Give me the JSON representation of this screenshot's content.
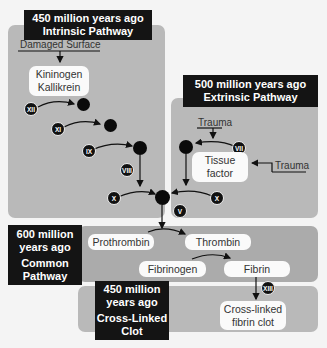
{
  "intrinsic": {
    "header_line1": "450 million years ago",
    "header_line2": "Intrinsic Pathway",
    "trigger": "Damaged Surface",
    "box_line1": "Kininogen",
    "box_line2": "Kallikrein",
    "factors": [
      "XII",
      "XI",
      "IX",
      "VIII",
      "X"
    ]
  },
  "extrinsic": {
    "header_line1": "500 million years ago",
    "header_line2": "Extrinsic Pathway",
    "trigger_top": "Trauma",
    "trigger_side": "Trauma",
    "box_line1": "Tissue",
    "box_line2": "factor",
    "factors": [
      "VII",
      "X"
    ]
  },
  "junction": {
    "factor": "V"
  },
  "common": {
    "header_line1": "600 million",
    "header_line2": "years ago",
    "header_line3": "Common",
    "header_line4": "Pathway",
    "prothrombin": "Prothrombin",
    "thrombin": "Thrombin",
    "fibrinogen": "Fibrinogen",
    "fibrin": "Fibrin"
  },
  "clot": {
    "header_line1": "450 million",
    "header_line2": "years ago",
    "header_line3": "Cross-Linked",
    "header_line4": "Clot",
    "factor": "XIII",
    "box_line1": "Cross-linked",
    "box_line2": "fibrin clot"
  },
  "colors": {
    "panel": "#b9b9b9",
    "panel_dark": "#ababab",
    "header": "#141414",
    "pill": "#fafafa"
  }
}
